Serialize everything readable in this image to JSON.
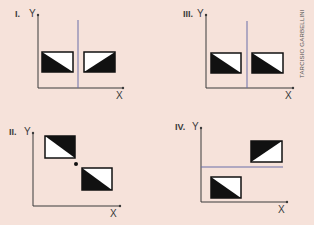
{
  "panels": [
    {
      "id": "I",
      "label": "I.",
      "ylabel": "Y",
      "xlabel": "X",
      "guide": "vertical",
      "boxes": [
        "black-lower-left-triangle",
        "black-lower-right-triangle"
      ]
    },
    {
      "id": "II",
      "label": "II.",
      "ylabel": "Y",
      "xlabel": "X",
      "guide": "point",
      "boxes": [
        "black-upper-right-triangle",
        "black-lower-left-triangle"
      ]
    },
    {
      "id": "III",
      "label": "III.",
      "ylabel": "Y",
      "xlabel": "X",
      "guide": "vertical",
      "boxes": [
        "black-lower-left-triangle",
        "black-lower-left-triangle"
      ]
    },
    {
      "id": "IV",
      "label": "IV.",
      "ylabel": "Y",
      "xlabel": "X",
      "guide": "horizontal",
      "boxes": [
        "black-upper-left-triangle",
        "black-lower-left-triangle"
      ]
    }
  ],
  "credit": "TARCISIO GARBELLINI",
  "colors": {
    "background": "#f6e2da",
    "axis": "#3a3a3a",
    "guide_line": "#6b6fa8",
    "fill": "#111111",
    "box_white": "#ffffff"
  }
}
